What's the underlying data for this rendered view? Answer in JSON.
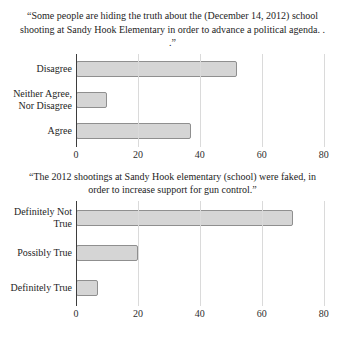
{
  "chart_data": [
    {
      "type": "bar",
      "orientation": "horizontal",
      "title": "“Some people are hiding the truth about the (December 14, 2012) school shooting at Sandy Hook Elementary in order to advance a political agenda. . .”",
      "categories": [
        "Disagree",
        "Neither Agree, Nor Disagree",
        "Agree"
      ],
      "values": [
        52,
        10,
        37
      ],
      "xlabel": "",
      "ylabel": "",
      "xlim": [
        0,
        80
      ],
      "xticks": [
        0,
        20,
        40,
        60,
        80
      ],
      "grid": "vertical",
      "legend": "none",
      "bar_color": "#d5d5d5",
      "bar_border_color": "#8f8f8f"
    },
    {
      "type": "bar",
      "orientation": "horizontal",
      "title": "“The 2012 shootings at Sandy Hook elementary (school) were faked, in order to increase support for gun control.”",
      "categories": [
        "Definitely Not True",
        "Possibly True",
        "Definitely True"
      ],
      "values": [
        70,
        20,
        7
      ],
      "xlabel": "",
      "ylabel": "",
      "xlim": [
        0,
        80
      ],
      "xticks": [
        0,
        20,
        40,
        60,
        80
      ],
      "grid": "vertical",
      "legend": "none",
      "bar_color": "#d5d5d5",
      "bar_border_color": "#8f8f8f"
    }
  ]
}
